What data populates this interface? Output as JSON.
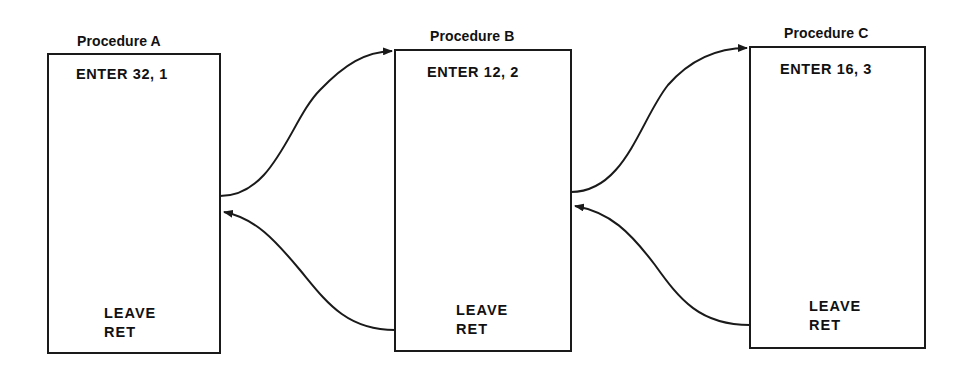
{
  "diagram": {
    "type": "procedure-call-nesting",
    "procedures": [
      {
        "title": "Procedure A",
        "enter": "ENTER 32, 1",
        "leave": "LEAVE",
        "ret": "RET"
      },
      {
        "title": "Procedure B",
        "enter": "ENTER 12, 2",
        "leave": "LEAVE",
        "ret": "RET"
      },
      {
        "title": "Procedure C",
        "enter": "ENTER 16, 3",
        "leave": "LEAVE",
        "ret": "RET"
      }
    ],
    "edges": [
      {
        "from": "Procedure A",
        "to": "Procedure B",
        "kind": "call"
      },
      {
        "from": "Procedure B",
        "to": "Procedure A",
        "kind": "return"
      },
      {
        "from": "Procedure B",
        "to": "Procedure C",
        "kind": "call"
      },
      {
        "from": "Procedure C",
        "to": "Procedure B",
        "kind": "return"
      }
    ],
    "colors": {
      "line": "#1a1a1a",
      "background": "#ffffff"
    }
  }
}
